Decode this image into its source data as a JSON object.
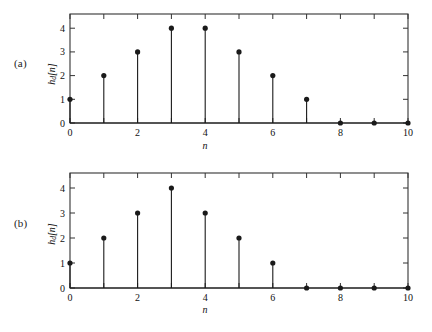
{
  "figure": {
    "background": "#ffffff",
    "stem_color": "#1a1a1a",
    "axis_color": "#333333"
  },
  "panels": [
    {
      "tag": "(a)",
      "ylabel_main": "h",
      "ylabel_sub": "d",
      "ylabel_tail": "[n]",
      "xlabel": "n"
    },
    {
      "tag": "(b)",
      "ylabel_main": "h",
      "ylabel_sub": "d",
      "ylabel_tail": "[n]",
      "xlabel": "n"
    }
  ],
  "chart_data": [
    {
      "type": "scatter",
      "subtype": "stem",
      "panel": "(a)",
      "title": "",
      "xlabel": "n",
      "ylabel": "hd[n]",
      "x": [
        0,
        1,
        2,
        3,
        4,
        5,
        6,
        7,
        8,
        9,
        10
      ],
      "values": [
        1,
        2,
        3,
        4,
        4,
        3,
        2,
        1,
        0,
        0,
        0
      ],
      "xlim": [
        0,
        10
      ],
      "ylim": [
        0,
        4.6
      ],
      "xticks": [
        0,
        1,
        2,
        3,
        4,
        5,
        6,
        7,
        8,
        9,
        10
      ],
      "xticklabels": [
        "0",
        "",
        "2",
        "",
        "4",
        "",
        "6",
        "",
        "8",
        "",
        "10"
      ],
      "yticks": [
        0,
        1,
        2,
        3,
        4
      ],
      "yticklabels": [
        "0",
        "1",
        "2",
        "3",
        "4"
      ],
      "grid": false,
      "legend": null
    },
    {
      "type": "scatter",
      "subtype": "stem",
      "panel": "(b)",
      "title": "",
      "xlabel": "n",
      "ylabel": "hd[n]",
      "x": [
        0,
        1,
        2,
        3,
        4,
        5,
        6,
        7,
        8,
        9,
        10
      ],
      "values": [
        1,
        2,
        3,
        4,
        3,
        2,
        1,
        0,
        0,
        0,
        0
      ],
      "xlim": [
        0,
        10
      ],
      "ylim": [
        0,
        4.6
      ],
      "xticks": [
        0,
        1,
        2,
        3,
        4,
        5,
        6,
        7,
        8,
        9,
        10
      ],
      "xticklabels": [
        "0",
        "",
        "2",
        "",
        "4",
        "",
        "6",
        "",
        "8",
        "",
        "10"
      ],
      "yticks": [
        0,
        1,
        2,
        3,
        4
      ],
      "yticklabels": [
        "0",
        "1",
        "2",
        "3",
        "4"
      ],
      "grid": false,
      "legend": null
    }
  ]
}
